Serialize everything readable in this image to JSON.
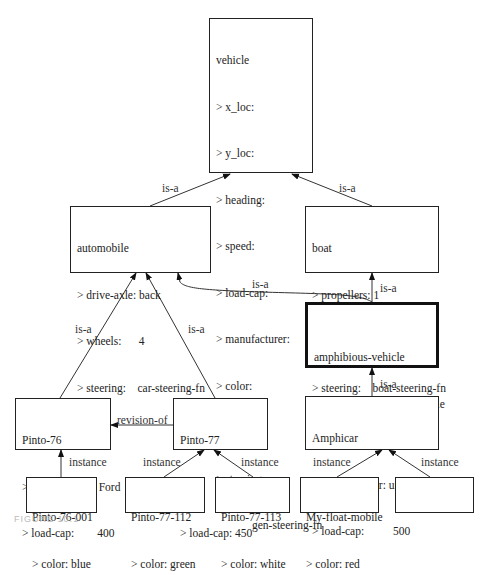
{
  "frames": {
    "vehicle": {
      "title": "vehicle",
      "slots": [
        "> x_loc:",
        "> y_loc:",
        "> heading:",
        "> speed:",
        "> load-cap:",
        "> manufacturer:",
        "> color:",
        "> owner:",
        "> steering:"
      ],
      "steering_value": "gen-steering-fn"
    },
    "automobile": {
      "title": "automobile",
      "slots": [
        "> drive-axle: back",
        "> wheels:      4",
        "> steering:    car-steering-fn"
      ]
    },
    "boat": {
      "title": "boat",
      "slots": [
        "> propellers: 1",
        "> hulls:        1",
        "> steering:    boat-steering-fn"
      ]
    },
    "amphibious_vehicle": {
      "title": "amphibious-vehicle",
      "slots": [
        "> lock-doors: lock-door-rule"
      ]
    },
    "pinto_76": {
      "title": "Pinto-76",
      "slots": [
        "> manufacturer: Ford",
        "> load-cap:        400"
      ]
    },
    "pinto_77": {
      "title": "Pinto-77",
      "slots": [
        "",
        "> load-cap: 450"
      ]
    },
    "amphicar": {
      "title": "Amphicar",
      "slots": [
        "> manufacturer: unknown",
        "> load-cap:          500"
      ]
    },
    "pinto_76_001": {
      "title": "Pinto-76-001",
      "slots": [
        "> color: blue"
      ]
    },
    "pinto_77_112": {
      "title": "Pinto-77-112",
      "slots": [
        "> color: green"
      ]
    },
    "pinto_77_113": {
      "title": "Pinto-77-113",
      "slots": [
        "> color: white"
      ]
    },
    "my_float_mobile": {
      "title": "My-float-mobile",
      "slots": [
        "> color: red"
      ]
    },
    "empty_instance": {
      "title": "",
      "slots": []
    }
  },
  "links": {
    "automobile_vehicle": "is-a",
    "boat_vehicle": "is-a",
    "amphibious_automobile": "is-a",
    "amphibious_boat": "is-a",
    "pinto76_automobile": "is-a",
    "pinto77_automobile": "is-a",
    "amphicar_amphibious": "is-a",
    "pinto77_pinto76": "revision-of",
    "pinto76001_pinto76": "instance",
    "pinto77112_pinto77": "instance",
    "pinto77113_pinto77": "instance",
    "myfloat_amphicar": "instance",
    "empty_amphicar": "instance"
  },
  "caption": "FIGURE 10.1"
}
